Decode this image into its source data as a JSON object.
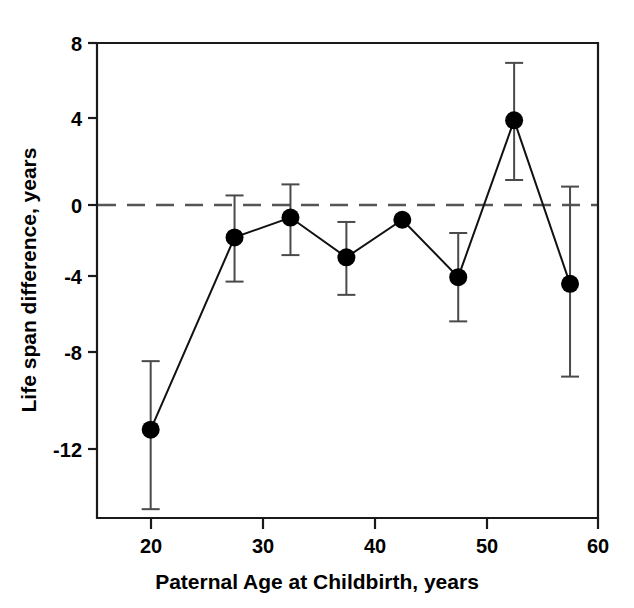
{
  "chart_data": {
    "type": "line",
    "title": "",
    "xlabel": "Paternal Age at Childbirth, years",
    "ylabel": "Life span difference, years",
    "xlim": [
      15.2,
      60.0
    ],
    "ylim": [
      -13.5,
      8.0
    ],
    "xticks": [
      20,
      30,
      40,
      50,
      60
    ],
    "xtick_labels": [
      "20",
      "30",
      "40",
      "50",
      "60"
    ],
    "yticks": [
      8,
      4,
      0,
      -4,
      -8,
      -12
    ],
    "ytick_labels": [
      "8",
      "4",
      "0",
      "-4",
      "-8",
      "-12"
    ],
    "grid": false,
    "legend": null,
    "reference_lines": [
      {
        "axis": "y",
        "value": 0,
        "style": "dashed"
      }
    ],
    "x": [
      20.0,
      27.5,
      32.5,
      37.5,
      42.5,
      47.5,
      52.5,
      57.5
    ],
    "values": [
      -9.5,
      -0.8,
      0.1,
      -1.7,
      0.0,
      -2.6,
      4.5,
      -2.9
    ],
    "err_low": [
      -13.1,
      -2.8,
      -1.6,
      -3.4,
      0.0,
      -4.6,
      1.8,
      -7.1
    ],
    "err_high": [
      -6.4,
      1.1,
      1.6,
      -0.1,
      0.0,
      -0.6,
      7.1,
      1.5
    ],
    "marker": "filled-circle",
    "marker_size": 9,
    "series": [
      {
        "name": "Life span difference",
        "x": [
          20.0,
          27.5,
          32.5,
          37.5,
          42.5,
          47.5,
          52.5,
          57.5
        ],
        "values": [
          -9.5,
          -0.8,
          0.1,
          -1.7,
          0.0,
          -2.6,
          4.5,
          -2.9
        ]
      }
    ]
  },
  "colors": {
    "axis": "#1a1a1a",
    "marker": "#000000",
    "line": "#111111",
    "error_bar": "#4a4a4a",
    "zero_line": "#555555",
    "background": "#ffffff"
  }
}
